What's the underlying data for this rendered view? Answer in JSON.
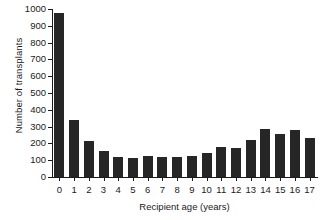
{
  "chart_data": {
    "type": "bar",
    "title": "",
    "xlabel": "Recipient age (years)",
    "ylabel": "Number of transplants",
    "categories": [
      "0",
      "1",
      "2",
      "3",
      "4",
      "5",
      "6",
      "7",
      "8",
      "9",
      "10",
      "11",
      "12",
      "13",
      "14",
      "15",
      "16",
      "17"
    ],
    "values": [
      975,
      340,
      215,
      152,
      122,
      115,
      126,
      122,
      117,
      124,
      141,
      181,
      175,
      221,
      286,
      259,
      278,
      233
    ],
    "ylim": [
      0,
      1000
    ],
    "ytick_labels": [
      "0",
      "100",
      "200",
      "300",
      "400",
      "500",
      "600",
      "700",
      "800",
      "900",
      "1000"
    ],
    "ytick_values": [
      0,
      100,
      200,
      300,
      400,
      500,
      600,
      700,
      800,
      900,
      1000
    ],
    "grid": false,
    "legend": "none",
    "bar_color": "#262626",
    "axis_color": "#1a1a1a",
    "background": "#ffffff"
  }
}
